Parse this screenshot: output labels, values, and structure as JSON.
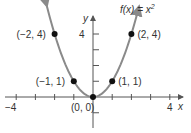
{
  "chart_data": {
    "type": "line",
    "function_label": {
      "prefix": "f(x) = x",
      "sup": "2"
    },
    "xlabel": "x",
    "ylabel": "y",
    "xlim": [
      -4.5,
      4.5
    ],
    "ylim": [
      -3,
      5.5
    ],
    "x_tick_labels": [
      "−4",
      "4"
    ],
    "y_tick_labels": [
      "4"
    ],
    "grid": false,
    "curve": {
      "expression": "x^2",
      "domain": [
        -2.4,
        2.4
      ],
      "color": "#8a8a8a",
      "arrows_at_ends": true
    },
    "points": [
      {
        "x": -2,
        "y": 4,
        "label": "(−2, 4)"
      },
      {
        "x": -1,
        "y": 1,
        "label": "(−1, 1)"
      },
      {
        "x": 0,
        "y": 0,
        "label": "(0, 0)"
      },
      {
        "x": 1,
        "y": 1,
        "label": "(1, 1)"
      },
      {
        "x": 2,
        "y": 4,
        "label": "(2, 4)"
      }
    ],
    "colors": {
      "axis": "#555555",
      "curve": "#8a8a8a",
      "points": "#111111"
    }
  }
}
